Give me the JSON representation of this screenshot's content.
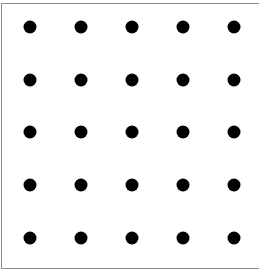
{
  "diagram": {
    "type": "dot-grid",
    "rows": 5,
    "cols": 5,
    "dot_color": "#000000",
    "border_color": "#8a8a8a",
    "background": "#ffffff",
    "x_positions": [
      30,
      81,
      132,
      183,
      234
    ],
    "y_positions": [
      27,
      80,
      132,
      185,
      238
    ]
  }
}
